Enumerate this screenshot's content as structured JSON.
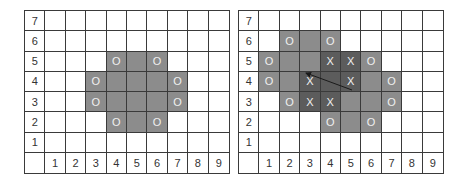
{
  "colors": {
    "grid_line": "#3a3a3a",
    "medium_shade": "#8c8c8c",
    "dark_shade": "#5c5c5c",
    "mark_text": "#f0f0f0",
    "arrow": "#1a1a1a"
  },
  "axes": {
    "rows": [
      "7",
      "6",
      "5",
      "4",
      "3",
      "2",
      "1"
    ],
    "cols": [
      "1",
      "2",
      "3",
      "4",
      "5",
      "6",
      "7",
      "8",
      "9"
    ]
  },
  "left_grid": {
    "cells": [
      {
        "col": 4,
        "row": 5,
        "shade": "medium",
        "mark": "O"
      },
      {
        "col": 5,
        "row": 5,
        "shade": "medium",
        "mark": ""
      },
      {
        "col": 6,
        "row": 5,
        "shade": "medium",
        "mark": "O"
      },
      {
        "col": 3,
        "row": 4,
        "shade": "medium",
        "mark": "O"
      },
      {
        "col": 4,
        "row": 4,
        "shade": "medium",
        "mark": ""
      },
      {
        "col": 5,
        "row": 4,
        "shade": "medium",
        "mark": ""
      },
      {
        "col": 6,
        "row": 4,
        "shade": "medium",
        "mark": ""
      },
      {
        "col": 7,
        "row": 4,
        "shade": "medium",
        "mark": "O"
      },
      {
        "col": 3,
        "row": 3,
        "shade": "medium",
        "mark": "O"
      },
      {
        "col": 4,
        "row": 3,
        "shade": "medium",
        "mark": ""
      },
      {
        "col": 5,
        "row": 3,
        "shade": "medium",
        "mark": ""
      },
      {
        "col": 6,
        "row": 3,
        "shade": "medium",
        "mark": ""
      },
      {
        "col": 7,
        "row": 3,
        "shade": "medium",
        "mark": "O"
      },
      {
        "col": 4,
        "row": 2,
        "shade": "medium",
        "mark": "O"
      },
      {
        "col": 5,
        "row": 2,
        "shade": "medium",
        "mark": ""
      },
      {
        "col": 6,
        "row": 2,
        "shade": "medium",
        "mark": "O"
      }
    ]
  },
  "right_grid": {
    "cells": [
      {
        "col": 2,
        "row": 6,
        "shade": "medium",
        "mark": "O"
      },
      {
        "col": 3,
        "row": 6,
        "shade": "medium",
        "mark": ""
      },
      {
        "col": 4,
        "row": 6,
        "shade": "medium",
        "mark": "O"
      },
      {
        "col": 1,
        "row": 5,
        "shade": "medium",
        "mark": "O"
      },
      {
        "col": 2,
        "row": 5,
        "shade": "medium",
        "mark": ""
      },
      {
        "col": 3,
        "row": 5,
        "shade": "medium",
        "mark": ""
      },
      {
        "col": 4,
        "row": 5,
        "shade": "dark",
        "mark": "X"
      },
      {
        "col": 5,
        "row": 5,
        "shade": "dark",
        "mark": "X"
      },
      {
        "col": 6,
        "row": 5,
        "shade": "medium",
        "mark": "O"
      },
      {
        "col": 1,
        "row": 4,
        "shade": "medium",
        "mark": "O"
      },
      {
        "col": 2,
        "row": 4,
        "shade": "medium",
        "mark": ""
      },
      {
        "col": 3,
        "row": 4,
        "shade": "dark",
        "mark": "X"
      },
      {
        "col": 4,
        "row": 4,
        "shade": "dark",
        "mark": ""
      },
      {
        "col": 5,
        "row": 4,
        "shade": "dark",
        "mark": "X"
      },
      {
        "col": 6,
        "row": 4,
        "shade": "medium",
        "mark": ""
      },
      {
        "col": 7,
        "row": 4,
        "shade": "medium",
        "mark": "O"
      },
      {
        "col": 2,
        "row": 3,
        "shade": "medium",
        "mark": "O"
      },
      {
        "col": 3,
        "row": 3,
        "shade": "dark",
        "mark": "X"
      },
      {
        "col": 4,
        "row": 3,
        "shade": "dark",
        "mark": "X"
      },
      {
        "col": 5,
        "row": 3,
        "shade": "medium",
        "mark": ""
      },
      {
        "col": 6,
        "row": 3,
        "shade": "medium",
        "mark": ""
      },
      {
        "col": 7,
        "row": 3,
        "shade": "medium",
        "mark": "O"
      },
      {
        "col": 4,
        "row": 2,
        "shade": "medium",
        "mark": "O"
      },
      {
        "col": 5,
        "row": 2,
        "shade": "medium",
        "mark": ""
      },
      {
        "col": 6,
        "row": 2,
        "shade": "medium",
        "mark": "O"
      }
    ],
    "arrow": {
      "from": {
        "x": 352,
        "y": 90
      },
      "to": {
        "x": 306,
        "y": 73
      }
    }
  }
}
